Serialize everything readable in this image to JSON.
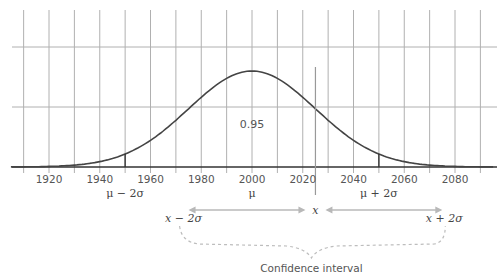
{
  "diagram": {
    "type": "normal-distribution-confidence-interval",
    "x_axis": {
      "min": 1905,
      "max": 2095,
      "grid_step": 10,
      "tick_labels": [
        "1920",
        "1940",
        "1960",
        "1980",
        "2000",
        "2020",
        "2040",
        "2060",
        "2080"
      ],
      "tick_values": [
        1920,
        1940,
        1960,
        1980,
        2000,
        2020,
        2040,
        2060,
        2080
      ]
    },
    "distribution": {
      "mean": 2000,
      "sigma": 25,
      "probability_label": "0.95"
    },
    "markers": {
      "mu_minus_2sigma": {
        "value": 1950,
        "label": "μ − 2σ"
      },
      "mu": {
        "value": 2000,
        "label": "μ"
      },
      "mu_plus_2sigma": {
        "value": 2050,
        "label": "μ + 2σ"
      },
      "x": {
        "value": 2025,
        "label": "x"
      }
    },
    "interval": {
      "lower_label": "x − 2σ",
      "upper_label": "x + 2σ",
      "caption": "Confidence interval"
    },
    "colors": {
      "grid": "#b0b0b0",
      "axis": "#333333",
      "curve": "#444444",
      "marker": "#333333",
      "x_marker": "#999999",
      "arrow": "#b8b8b8",
      "brace": "#bdbdbd"
    }
  }
}
